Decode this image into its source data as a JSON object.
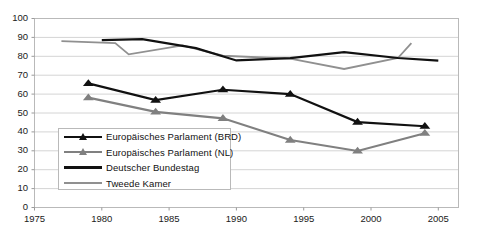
{
  "chart_data": {
    "type": "line",
    "title": "",
    "subtitle": "",
    "xlabel": "",
    "ylabel": "",
    "xlim": [
      1975,
      2006.5
    ],
    "ylim": [
      0,
      100
    ],
    "xticks": [
      1975,
      1980,
      1985,
      1990,
      1995,
      2000,
      2005
    ],
    "xtick_labels": [
      "1975",
      "1980",
      "1985",
      "1990",
      "1995",
      "2000",
      "2005"
    ],
    "yticks": [
      0,
      10,
      20,
      30,
      40,
      50,
      60,
      70,
      80,
      90,
      100
    ],
    "ytick_labels": [
      "0",
      "10",
      "20",
      "30",
      "40",
      "50",
      "60",
      "70",
      "80",
      "90",
      "100"
    ],
    "grid": "horizontal",
    "legend_position": "inside-lower-left",
    "colors": {
      "ep_brd": "#111111",
      "ep_nl": "#808080",
      "bundestag": "#111111",
      "tweede_kamer": "#909090",
      "gridline": "#d4d4d4",
      "axis": "#9a9a9a",
      "plot_border": "#b9b9b9",
      "background": "#ffffff"
    },
    "series": [
      {
        "name": "Europäisches Parlament (BRD)",
        "key": "ep_brd",
        "color": "#111111",
        "marker": "triangle",
        "width": 2.2,
        "x": [
          1979,
          1984,
          1989,
          1994,
          1999,
          2004
        ],
        "values": [
          65.7,
          56.8,
          62.3,
          60.0,
          45.2,
          43.0
        ]
      },
      {
        "name": "Europäisches Parlament (NL)",
        "key": "ep_nl",
        "color": "#808080",
        "marker": "triangle",
        "width": 2.2,
        "x": [
          1979,
          1984,
          1989,
          1994,
          1999,
          2004
        ],
        "values": [
          58.1,
          50.6,
          47.2,
          35.7,
          29.9,
          39.3
        ]
      },
      {
        "name": "Deutscher Bundestag",
        "key": "bundestag",
        "color": "#111111",
        "marker": "none",
        "width": 2.2,
        "x": [
          1980,
          1983,
          1987,
          1990,
          1994,
          1998,
          2002,
          2005
        ],
        "values": [
          88.6,
          89.1,
          84.3,
          77.8,
          79.0,
          82.2,
          79.1,
          77.7
        ]
      },
      {
        "name": "Tweede Kamer",
        "key": "tweede_kamer",
        "color": "#909090",
        "marker": "none",
        "width": 1.8,
        "x": [
          1977,
          1981,
          1982,
          1986,
          1989,
          1994,
          1998,
          2002,
          2003
        ],
        "values": [
          88.0,
          87.0,
          81.0,
          85.8,
          80.3,
          78.8,
          73.3,
          79.1,
          87.0
        ]
      }
    ]
  },
  "legend": {
    "items": [
      {
        "label": "Europäisches Parlament (BRD)",
        "key": "ep_brd"
      },
      {
        "label": "Europäisches Parlament (NL)",
        "key": "ep_nl"
      },
      {
        "label": "Deutscher Bundestag",
        "key": "bundestag"
      },
      {
        "label": "Tweede Kamer",
        "key": "tweede_kamer"
      }
    ]
  }
}
